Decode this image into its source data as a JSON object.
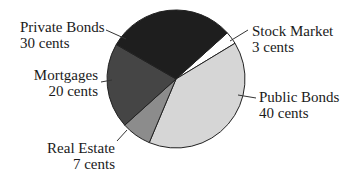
{
  "chart_data": {
    "type": "pie",
    "title": "",
    "unit": "cents",
    "total": 100,
    "start_angle_deg_clockwise_from_top": 48,
    "slices": [
      {
        "name": "Stock Market",
        "value": 3,
        "value_label": "3 cents",
        "color": "#ffffff"
      },
      {
        "name": "Public Bonds",
        "value": 40,
        "value_label": "40 cents",
        "color": "#d6d6d6"
      },
      {
        "name": "Real Estate",
        "value": 7,
        "value_label": "7 cents",
        "color": "#8c8c8c"
      },
      {
        "name": "Mortgages",
        "value": 20,
        "value_label": "20 cents",
        "color": "#454545"
      },
      {
        "name": "Private Bonds",
        "value": 30,
        "value_label": "30 cents",
        "color": "#1e1e1e"
      }
    ],
    "categories": [
      "Stock Market",
      "Public Bonds",
      "Real Estate",
      "Mortgages",
      "Private Bonds"
    ],
    "values": [
      3,
      40,
      7,
      20,
      30
    ],
    "legend": "none (callout labels with leader lines)"
  },
  "labels": {
    "private_bonds": {
      "name": "Private Bonds",
      "value": "30 cents"
    },
    "stock_market": {
      "name": "Stock Market",
      "value": "3 cents"
    },
    "mortgages": {
      "name": "Mortgages",
      "value": "20 cents"
    },
    "real_estate": {
      "name": "Real Estate",
      "value": "7 cents"
    },
    "public_bonds": {
      "name": "Public Bonds",
      "value": "40 cents"
    }
  }
}
